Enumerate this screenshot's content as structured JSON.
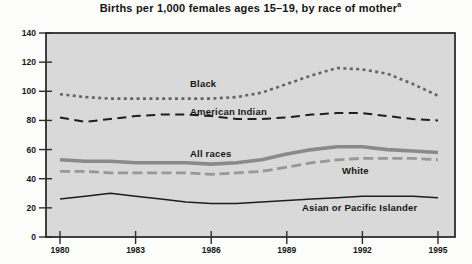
{
  "title": "Births per 1,000 females ages 15–19, by race of mother",
  "title_superscript": "a",
  "chart_data": {
    "type": "line",
    "title": "Births per 1,000 females ages 15–19, by race of mother",
    "footnote_marker": "a",
    "x": [
      1980,
      1981,
      1982,
      1983,
      1984,
      1985,
      1986,
      1987,
      1988,
      1989,
      1990,
      1991,
      1992,
      1993,
      1994,
      1995
    ],
    "series": [
      {
        "name": "Black",
        "values": [
          98,
          96,
          95,
          95,
          95,
          95,
          95,
          96,
          99,
          105,
          111,
          116,
          115,
          112,
          105,
          97
        ],
        "color": "#646464",
        "dash": "3 3.4",
        "width": 2.6,
        "label_xy": [
          190,
          87
        ]
      },
      {
        "name": "American Indian",
        "values": [
          82,
          79,
          81,
          83,
          84,
          84,
          83,
          81,
          81,
          82,
          84,
          85,
          85,
          83,
          81,
          80
        ],
        "color": "#1e1e1e",
        "dash": "9 5.5",
        "width": 2,
        "label_xy": [
          190,
          115
        ]
      },
      {
        "name": "All races",
        "values": [
          53,
          52,
          52,
          51,
          51,
          51,
          50,
          51,
          53,
          57,
          60,
          62,
          62,
          60,
          59,
          58
        ],
        "color": "#8a8a8a",
        "dash": "",
        "width": 3.6,
        "label_xy": [
          190,
          157
        ]
      },
      {
        "name": "White",
        "values": [
          45,
          45,
          44,
          44,
          44,
          44,
          43,
          44,
          45,
          48,
          51,
          53,
          54,
          54,
          54,
          53
        ],
        "color": "#989898",
        "dash": "10 4.5",
        "width": 2.8,
        "label_xy": [
          342,
          174
        ]
      },
      {
        "name": "Asian or Pacific Islander",
        "values": [
          26,
          28,
          30,
          28,
          26,
          24,
          23,
          23,
          24,
          25,
          26,
          27,
          28,
          28,
          28,
          27
        ],
        "color": "#1e1e1e",
        "dash": "",
        "width": 1.5,
        "label_xy": [
          302,
          211
        ]
      }
    ],
    "xticks": [
      1980,
      1983,
      1986,
      1989,
      1992,
      1995
    ],
    "yticks": [
      0,
      20,
      40,
      60,
      80,
      100,
      120,
      140
    ],
    "xlim": [
      1980,
      1995
    ],
    "ylim": [
      0,
      140
    ],
    "grid": false,
    "legend_position": "inline-labels",
    "plot_bg": "#d9d9d9",
    "frame_color": "#2d2d2d",
    "tick_label_color": "#161616",
    "series_label_color": "#161616"
  }
}
